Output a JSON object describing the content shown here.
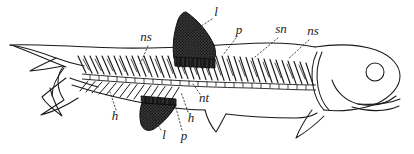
{
  "figure": {
    "type": "anatomical-illustration",
    "background_color": "#ffffff",
    "ink_color": "#1a1a1a",
    "width": 414,
    "height": 154
  },
  "labels": [
    {
      "key": "l-dorsal",
      "text": "l",
      "x": 216,
      "y": 13,
      "leader": "M 212 19 L 186 36"
    },
    {
      "key": "ns-left",
      "text": "ns",
      "x": 146,
      "y": 38,
      "leader": "M 148 46 L 140 64"
    },
    {
      "key": "p-dorsal",
      "text": "p",
      "x": 239,
      "y": 31,
      "leader": "M 236 38 L 223 55"
    },
    {
      "key": "sn-right",
      "text": "sn",
      "x": 281,
      "y": 30,
      "leader": "M 278 38 L 255 57"
    },
    {
      "key": "ns-right",
      "text": "ns",
      "x": 313,
      "y": 32,
      "leader": "M 309 40 L 288 59"
    },
    {
      "key": "nt-center",
      "text": "nt",
      "x": 204,
      "y": 99,
      "leader": "M 200 94 L 193 84"
    },
    {
      "key": "h-left",
      "text": "h",
      "x": 115,
      "y": 117,
      "leader": "M 116 110 L 110 92"
    },
    {
      "key": "l-ventral",
      "text": "l",
      "x": 164,
      "y": 136,
      "leader": "M 161 130 L 150 112"
    },
    {
      "key": "p-ventral",
      "text": "p",
      "x": 184,
      "y": 137,
      "leader": "M 182 130 L 176 108"
    },
    {
      "key": "h-right",
      "text": "h",
      "x": 191,
      "y": 119,
      "leader": "M 188 112 L 181 92"
    }
  ],
  "legend_keys": {
    "ns": "neural spine",
    "sn": "supraneural",
    "nt": "notochord",
    "h": "hemal spine",
    "l": "fin lepidotrichia",
    "p": "pterygiophore"
  },
  "anatomy_parts": [
    "caudal-fin",
    "dorsal-fin",
    "pelvic-fin",
    "anal-fin",
    "pectoral-fin",
    "head",
    "eye",
    "jaw",
    "operculum",
    "vertebral-column",
    "neural-spines",
    "hemal-spines"
  ]
}
